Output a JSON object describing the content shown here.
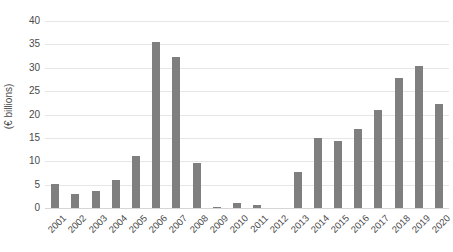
{
  "chart_data": {
    "type": "bar",
    "title": "",
    "subtitle": "",
    "xlabel": "",
    "ylabel": "(€ billions)",
    "ylim": [
      0,
      40
    ],
    "ytick_labels": [
      "0",
      "5",
      "10",
      "15",
      "20",
      "25",
      "30",
      "35",
      "40"
    ],
    "ytick_values": [
      0,
      5,
      10,
      15,
      20,
      25,
      30,
      35,
      40
    ],
    "grid": true,
    "legend": "none",
    "bar_color": "#7f7f7f",
    "gridline_color": "#e6e6e6",
    "background_color": "#ffffff",
    "categories": [
      "2001",
      "2002",
      "2003",
      "2004",
      "2005",
      "2006",
      "2007",
      "2008",
      "2009",
      "2010",
      "2011",
      "2012",
      "2013",
      "2014",
      "2015",
      "2016",
      "2017",
      "2018",
      "2019",
      "2020"
    ],
    "values": [
      5.2,
      3.1,
      3.7,
      5.9,
      11.1,
      35.5,
      32.2,
      9.6,
      0.3,
      1.1,
      0.6,
      0.0,
      7.7,
      15.0,
      14.3,
      17.0,
      21.0,
      27.8,
      30.3,
      22.3
    ]
  }
}
